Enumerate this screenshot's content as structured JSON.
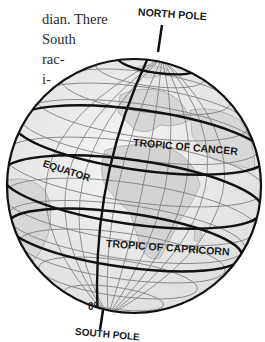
{
  "body_text": {
    "lines": [
      "dian. There",
      "South",
      "rac-",
      "i-"
    ]
  },
  "globe": {
    "labels": {
      "north_pole": "NORTH POLE",
      "south_pole": "SOUTH POLE",
      "tropic_of_cancer": "TROPIC OF CANCER",
      "equator": "EQUATOR",
      "tropic_of_capricorn": "TROPIC OF CAPRICORN",
      "prime_meridian_degree": "0°"
    },
    "colors": {
      "globe_fill": "#ececec",
      "land_fill": "#d9d9d9",
      "grid_line": "#7a7a7a",
      "highlight_line": "#111111"
    }
  }
}
